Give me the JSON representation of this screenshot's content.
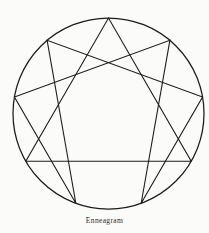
{
  "figure": {
    "caption": "Enneagram",
    "title": "Enneagram",
    "background_color": "#fbfbf9",
    "stroke_color": "#1c1c1c",
    "caption_color": "#2b2b2b"
  },
  "chart_data": {
    "type": "diagram",
    "title": "Enneagram",
    "subtitle": "",
    "xlabel": "",
    "ylabel": "",
    "grid": false,
    "legend": "none",
    "circle": {
      "cx": 108.5,
      "cy": 113.5,
      "r": 95.5
    },
    "point_count": 9,
    "start_angle_deg": -90,
    "points": [
      {
        "label": "1",
        "angle_deg": -50,
        "x": 169.9,
        "y": 40.4
      },
      {
        "label": "2",
        "angle_deg": -10,
        "x": 202.5,
        "y": 96.9
      },
      {
        "label": "3",
        "angle_deg": 30,
        "x": 191.2,
        "y": 161.3
      },
      {
        "label": "4",
        "angle_deg": 70,
        "x": 141.2,
        "y": 203.2
      },
      {
        "label": "5",
        "angle_deg": 110,
        "x": 75.8,
        "y": 203.2
      },
      {
        "label": "6",
        "angle_deg": 150,
        "x": 25.8,
        "y": 161.3
      },
      {
        "label": "7",
        "angle_deg": 190,
        "x": 14.5,
        "y": 96.9
      },
      {
        "label": "8",
        "angle_deg": 230,
        "x": 47.1,
        "y": 40.4
      },
      {
        "label": "9",
        "angle_deg": 270,
        "x": 108.5,
        "y": 18.0
      }
    ],
    "triangle_path": [
      "3",
      "6",
      "9"
    ],
    "hexad_path": [
      "1",
      "4",
      "2",
      "8",
      "5",
      "7"
    ],
    "line_width": 1.1
  }
}
